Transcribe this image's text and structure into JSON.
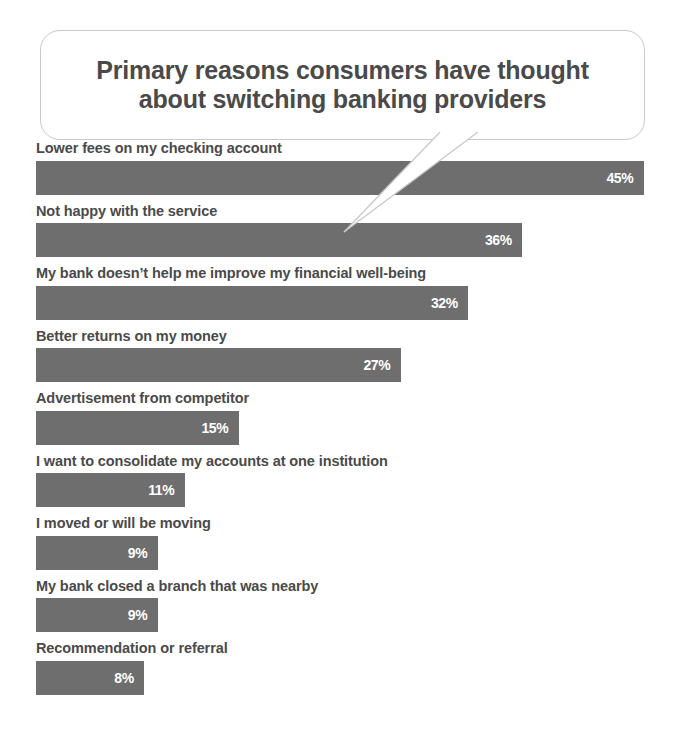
{
  "title": {
    "line1": "Primary reasons consumers have thought",
    "line2": "about switching banking providers",
    "full": "Primary reasons consumers have thought\nabout switching banking providers"
  },
  "colors": {
    "bar": "#6e6e6e",
    "label_text": "#4a4a4a",
    "value_text": "#ffffff",
    "bubble_border": "#c9c9c9",
    "background": "#ffffff"
  },
  "chart_data": {
    "type": "bar",
    "orientation": "horizontal",
    "title": "Primary reasons consumers have thought about switching banking providers",
    "xlabel": "",
    "ylabel": "",
    "xlim": [
      0,
      45
    ],
    "grid": false,
    "legend": null,
    "value_suffix": "%",
    "categories": [
      "Lower fees on my checking account",
      "Not happy with the service",
      "My bank doesn’t help me improve my financial well-being",
      "Better returns on my money",
      "Advertisement from competitor",
      "I want to consolidate my accounts at one institution",
      "I moved or will be moving",
      "My bank closed a branch that was nearby",
      "Recommendation or referral"
    ],
    "values": [
      45,
      36,
      32,
      27,
      15,
      11,
      9,
      9,
      8
    ],
    "value_labels": [
      "45%",
      "36%",
      "32%",
      "27%",
      "15%",
      "11%",
      "9%",
      "9%",
      "8%"
    ],
    "bars": [
      {
        "label": "Lower fees on my checking account",
        "value": 45,
        "value_label": "45%"
      },
      {
        "label": "Not happy with the service",
        "value": 36,
        "value_label": "36%"
      },
      {
        "label": "My bank doesn’t help me improve my financial well-being",
        "value": 32,
        "value_label": "32%"
      },
      {
        "label": "Better returns on my money",
        "value": 27,
        "value_label": "27%"
      },
      {
        "label": "Advertisement from competitor",
        "value": 15,
        "value_label": "15%"
      },
      {
        "label": "I want to consolidate my accounts at one institution",
        "value": 11,
        "value_label": "11%"
      },
      {
        "label": "I moved or will be moving",
        "value": 9,
        "value_label": "9%"
      },
      {
        "label": "My bank closed a branch that was nearby",
        "value": 9,
        "value_label": "9%"
      },
      {
        "label": "Recommendation or referral",
        "value": 8,
        "value_label": "8%"
      }
    ]
  }
}
